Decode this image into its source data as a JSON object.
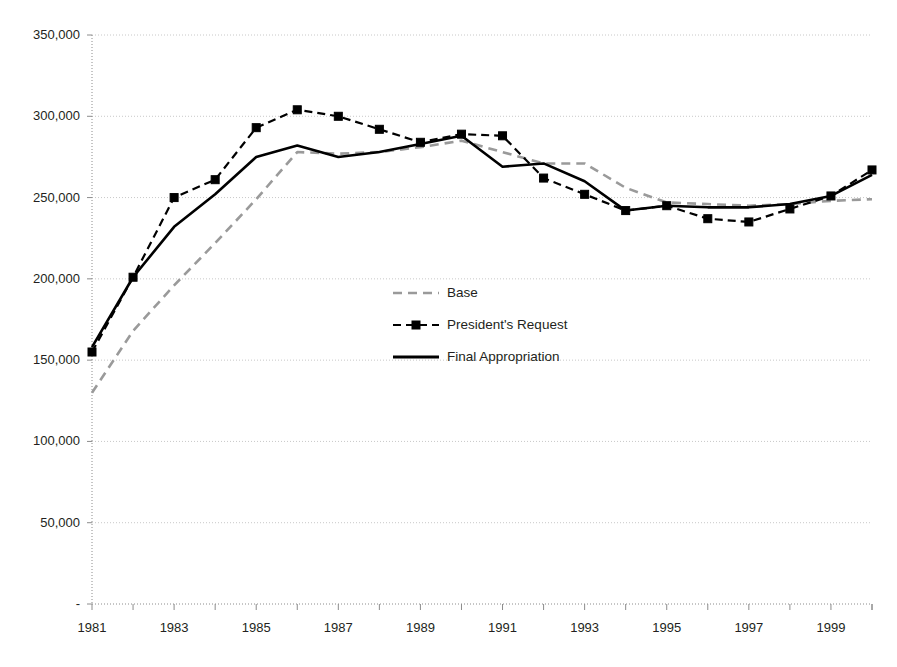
{
  "chart_data": {
    "type": "line",
    "title": "",
    "subtitle": "",
    "xlabel": "",
    "ylabel": "",
    "x": [
      1981,
      1982,
      1983,
      1984,
      1985,
      1986,
      1987,
      1988,
      1989,
      1990,
      1991,
      1992,
      1993,
      1994,
      1995,
      1996,
      1997,
      1998,
      1999,
      2000
    ],
    "xlim": [
      1981,
      2000
    ],
    "ylim": [
      0,
      350000
    ],
    "grid": true,
    "legend_position": "center",
    "y_ticks": [
      0,
      50000,
      100000,
      150000,
      200000,
      250000,
      300000,
      350000
    ],
    "y_tick_labels": [
      "-",
      "50,000",
      "100,000",
      "150,000",
      "200,000",
      "250,000",
      "300,000",
      "350,000"
    ],
    "x_tick_labels": [
      "1981",
      "",
      "1983",
      "",
      "1985",
      "",
      "1987",
      "",
      "1989",
      "",
      "1991",
      "",
      "1993",
      "",
      "1995",
      "",
      "1997",
      "",
      "1999",
      ""
    ],
    "x_major_labels": [
      "1981",
      "1983",
      "1985",
      "1987",
      "1989",
      "1991",
      "1993",
      "1995",
      "1997",
      "1999"
    ],
    "series": [
      {
        "name": "Base",
        "style": "dashed",
        "color": "#9a9a9a",
        "marker": "none",
        "values": [
          130000,
          168000,
          196000,
          222000,
          249000,
          278000,
          277000,
          278000,
          281000,
          285000,
          278000,
          271000,
          271000,
          256000,
          247000,
          246000,
          245000,
          246000,
          248000,
          249000
        ]
      },
      {
        "name": "President's Request",
        "style": "dashed",
        "color": "#000000",
        "marker": "square",
        "values": [
          155000,
          201000,
          250000,
          261000,
          293000,
          304000,
          300000,
          292000,
          284000,
          289000,
          288000,
          262000,
          252000,
          242000,
          245000,
          237000,
          235000,
          243000,
          251000,
          267000
        ]
      },
      {
        "name": "Final Appropriation",
        "style": "solid",
        "color": "#000000",
        "marker": "none",
        "values": [
          158000,
          201000,
          232000,
          252000,
          275000,
          282000,
          275000,
          278000,
          283000,
          288000,
          269000,
          271000,
          260000,
          242000,
          245000,
          244000,
          244000,
          246000,
          251000,
          264000
        ]
      }
    ]
  },
  "legend": {
    "items": [
      {
        "label": "Base"
      },
      {
        "label": "President's Request"
      },
      {
        "label": "Final Appropriation"
      }
    ]
  },
  "axes": {
    "y_labels": [
      "350,000",
      "300,000",
      "250,000",
      "200,000",
      "150,000",
      "100,000",
      "50,000",
      "-"
    ],
    "x_labels": [
      "1981",
      "1983",
      "1985",
      "1987",
      "1989",
      "1991",
      "1993",
      "1995",
      "1997",
      "1999"
    ]
  },
  "colors": {
    "base_line": "#9a9a9a",
    "request_line": "#000000",
    "final_line": "#000000",
    "gridline": "#c8c8c8",
    "axis": "#8c8c8c",
    "text": "#231f20"
  }
}
